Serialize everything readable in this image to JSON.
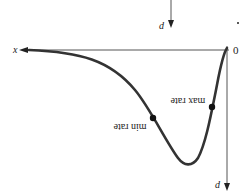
{
  "diagram": {
    "axes": {
      "horizontal_label": "x",
      "origin_label": "0",
      "vertical_label": "d",
      "top_arrow_label": "d"
    },
    "curve": {
      "points": [
        [
          29,
          50
        ],
        [
          90,
          58
        ],
        [
          130,
          85
        ],
        [
          153,
          118
        ],
        [
          175,
          160
        ],
        [
          188,
          164
        ],
        [
          202,
          140
        ],
        [
          212,
          107
        ],
        [
          227,
          48
        ]
      ]
    },
    "markers": [
      {
        "name": "min-rate",
        "label": "min rate",
        "x": 153,
        "y": 118
      },
      {
        "name": "max-rate",
        "label": "max rate",
        "x": 212,
        "y": 107
      }
    ],
    "colors": {
      "curve": "#333333",
      "axis": "#555555"
    }
  }
}
